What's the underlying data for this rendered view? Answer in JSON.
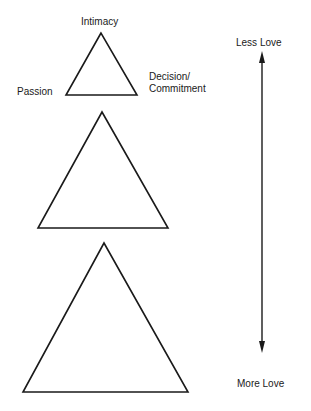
{
  "labels": {
    "intimacy": "Intimacy",
    "passion": "Passion",
    "decision_line1": "Decision/",
    "decision_line2": "Commitment",
    "less_love": "Less Love",
    "more_love": "More Love"
  },
  "triangles": [
    {
      "size": "small",
      "apex": [
        101,
        33
      ],
      "base_left": [
        66,
        95
      ],
      "base_right": [
        137,
        95
      ]
    },
    {
      "size": "medium",
      "apex": [
        102,
        112
      ],
      "base_left": [
        38,
        228
      ],
      "base_right": [
        168,
        228
      ]
    },
    {
      "size": "large",
      "apex": [
        104,
        243
      ],
      "base_left": [
        23,
        392
      ],
      "base_right": [
        188,
        392
      ]
    }
  ],
  "arrow": {
    "x": 262,
    "top": 52,
    "bottom": 352
  },
  "colors": {
    "line": "#1a1a1a",
    "background": "#ffffff"
  }
}
